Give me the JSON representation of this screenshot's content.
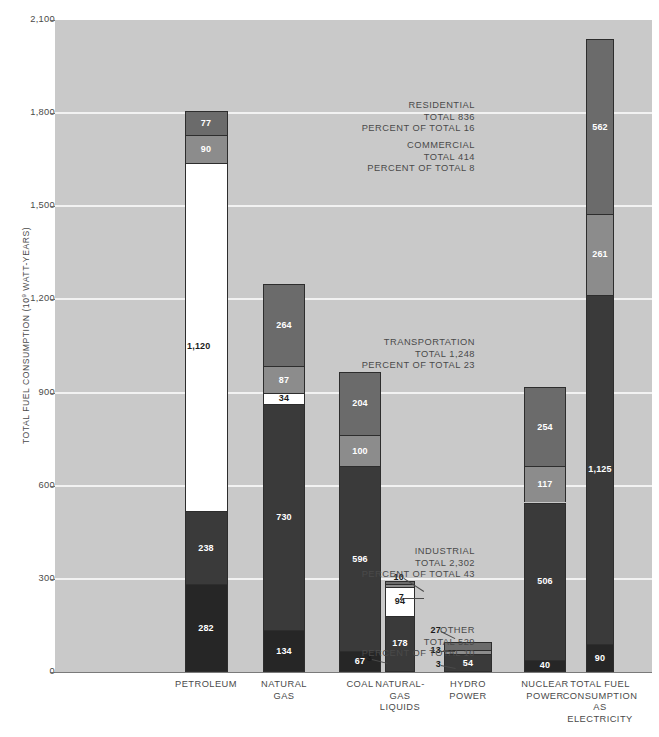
{
  "axis": {
    "y_title": "TOTAL FUEL CONSUMPTION (10",
    "y_title_exp": "9",
    "y_title_tail": " WATT-YEARS)",
    "y_ticks": [
      "2,100",
      "1,800",
      "1,500",
      "1,200",
      "900",
      "600",
      "300",
      "0"
    ]
  },
  "sectors": [
    {
      "name": "RESIDENTIAL",
      "total_label": "TOTAL  836",
      "pct_label": "PERCENT OF TOTAL  16",
      "total": 836,
      "percent": 16,
      "color": "#6b6b6b"
    },
    {
      "name": "COMMERCIAL",
      "total_label": "TOTAL  414",
      "pct_label": "PERCENT OF TOTAL  8",
      "total": 414,
      "percent": 8,
      "color": "#8c8c8c"
    },
    {
      "name": "TRANSPORTATION",
      "total_label": "TOTAL  1,248",
      "pct_label": "PERCENT OF TOTAL  23",
      "total": 1248,
      "percent": 23,
      "color": "#ffffff"
    },
    {
      "name": "INDUSTRIAL",
      "total_label": "TOTAL  2,302",
      "pct_label": "PERCENT OF TOTAL  43",
      "total": 2302,
      "percent": 43,
      "color": "#3a3a3a"
    },
    {
      "name": "OTHER",
      "total_label": "TOTAL  529",
      "pct_label": "PERCENT OF TOTAL  10",
      "total": 529,
      "percent": 10,
      "color": "#262626"
    }
  ],
  "chart_data": {
    "type": "bar",
    "title": "",
    "subtype": "stacked",
    "xlabel": "",
    "ylabel": "TOTAL FUEL CONSUMPTION (10^9 WATT-YEARS)",
    "ylim": [
      0,
      2100
    ],
    "ytick_values": [
      0,
      300,
      600,
      900,
      1200,
      1500,
      1800,
      2100
    ],
    "grid": true,
    "legend": "none",
    "categories": [
      "PETROLEUM",
      "NATURAL GAS",
      "COAL",
      "NATURAL-GAS LIQUIDS",
      "HYDRO POWER",
      "NUCLEAR POWER",
      "TOTAL FUEL CONSUMPTION AS ELECTRICITY"
    ],
    "category_lines": [
      [
        "PETROLEUM"
      ],
      [
        "NATURAL",
        "GAS"
      ],
      [
        "COAL"
      ],
      [
        "NATURAL-",
        "GAS",
        "LIQUIDS"
      ],
      [
        "HYDRO",
        "POWER"
      ],
      [
        "NUCLEAR",
        "POWER"
      ],
      [
        "TOTAL FUEL",
        "CONSUMPTION",
        "AS",
        "ELECTRICITY"
      ]
    ],
    "series": [
      {
        "name": "OTHER",
        "values": [
          282,
          134,
          67,
          3,
          3,
          40,
          90
        ]
      },
      {
        "name": "INDUSTRIAL",
        "values": [
          238,
          730,
          596,
          178,
          54,
          506,
          1125
        ]
      },
      {
        "name": "TRANSPORTATION",
        "values": [
          1120,
          34,
          0,
          94,
          0,
          0,
          0
        ]
      },
      {
        "name": "COMMERCIAL",
        "values": [
          90,
          87,
          100,
          7,
          13,
          117,
          261
        ]
      },
      {
        "name": "RESIDENTIAL",
        "values": [
          77,
          264,
          204,
          10,
          27,
          254,
          562
        ]
      }
    ],
    "bar_totals": [
      1807,
      1249,
      967,
      292,
      97,
      917,
      2038
    ]
  },
  "bars": [
    {
      "category": "PETROLEUM",
      "segments": [
        {
          "sector": "OTHER",
          "value": 282,
          "label": "282",
          "label_color": "white"
        },
        {
          "sector": "INDUSTRIAL",
          "value": 238,
          "label": "238",
          "label_color": "white"
        },
        {
          "sector": "TRANSPORTATION",
          "value": 1120,
          "label": "1,120",
          "label_color": "dark",
          "label_position": "left-outside"
        },
        {
          "sector": "COMMERCIAL",
          "value": 90,
          "label": "90",
          "label_color": "white"
        },
        {
          "sector": "RESIDENTIAL",
          "value": 77,
          "label": "77",
          "label_color": "white"
        }
      ]
    },
    {
      "category": "NATURAL GAS",
      "segments": [
        {
          "sector": "OTHER",
          "value": 134,
          "label": "134",
          "label_color": "white"
        },
        {
          "sector": "INDUSTRIAL",
          "value": 730,
          "label": "730",
          "label_color": "white"
        },
        {
          "sector": "TRANSPORTATION",
          "value": 34,
          "label": "34",
          "label_color": "dark"
        },
        {
          "sector": "COMMERCIAL",
          "value": 87,
          "label": "87",
          "label_color": "white"
        },
        {
          "sector": "RESIDENTIAL",
          "value": 264,
          "label": "264",
          "label_color": "white"
        }
      ]
    },
    {
      "category": "COAL",
      "segments": [
        {
          "sector": "OTHER",
          "value": 67,
          "label": "67",
          "label_color": "white"
        },
        {
          "sector": "INDUSTRIAL",
          "value": 596,
          "label": "596",
          "label_color": "white"
        },
        {
          "sector": "COMMERCIAL",
          "value": 100,
          "label": "100",
          "label_color": "white"
        },
        {
          "sector": "RESIDENTIAL",
          "value": 204,
          "label": "204",
          "label_color": "white"
        }
      ]
    },
    {
      "category": "NATURAL-GAS LIQUIDS",
      "segments": [
        {
          "sector": "OTHER",
          "value": 3,
          "label": "3",
          "label_color": "dark",
          "label_position": "callout"
        },
        {
          "sector": "INDUSTRIAL",
          "value": 178,
          "label": "178",
          "label_color": "white"
        },
        {
          "sector": "TRANSPORTATION",
          "value": 94,
          "label": "94",
          "label_color": "dark"
        },
        {
          "sector": "COMMERCIAL",
          "value": 7,
          "label": "7",
          "label_color": "dark",
          "label_position": "callout"
        },
        {
          "sector": "RESIDENTIAL",
          "value": 10,
          "label": "10",
          "label_color": "dark",
          "label_position": "callout"
        }
      ]
    },
    {
      "category": "HYDRO POWER",
      "segments": [
        {
          "sector": "OTHER",
          "value": 3,
          "label": "3",
          "label_color": "dark",
          "label_position": "callout"
        },
        {
          "sector": "INDUSTRIAL",
          "value": 54,
          "label": "54",
          "label_color": "white"
        },
        {
          "sector": "COMMERCIAL",
          "value": 13,
          "label": "13",
          "label_color": "dark",
          "label_position": "callout"
        },
        {
          "sector": "RESIDENTIAL",
          "value": 27,
          "label": "27",
          "label_color": "dark",
          "label_position": "callout"
        }
      ]
    },
    {
      "category": "NUCLEAR POWER",
      "segments": [
        {
          "sector": "OTHER",
          "value": 40,
          "label": "40",
          "label_color": "white"
        },
        {
          "sector": "INDUSTRIAL",
          "value": 506,
          "label": "506",
          "label_color": "white"
        },
        {
          "sector": "COMMERCIAL",
          "value": 117,
          "label": "117",
          "label_color": "white"
        },
        {
          "sector": "RESIDENTIAL",
          "value": 254,
          "label": "254",
          "label_color": "white"
        }
      ]
    },
    {
      "category": "TOTAL FUEL CONSUMPTION AS ELECTRICITY",
      "segments": [
        {
          "sector": "OTHER",
          "value": 90,
          "label": "90",
          "label_color": "white"
        },
        {
          "sector": "INDUSTRIAL",
          "value": 1125,
          "label": "1,125",
          "label_color": "white"
        },
        {
          "sector": "COMMERCIAL",
          "value": 261,
          "label": "261",
          "label_color": "white"
        },
        {
          "sector": "RESIDENTIAL",
          "value": 562,
          "label": "562",
          "label_color": "white"
        }
      ]
    }
  ],
  "colors": {
    "plot_background": "#c9c9c9",
    "gridline": "#f2f2f2",
    "residential": "#6b6b6b",
    "commercial": "#8c8c8c",
    "transportation": "#ffffff",
    "industrial": "#3a3a3a",
    "other": "#262626",
    "outline": "#2d2d2d",
    "text": "#4a4a4a"
  }
}
